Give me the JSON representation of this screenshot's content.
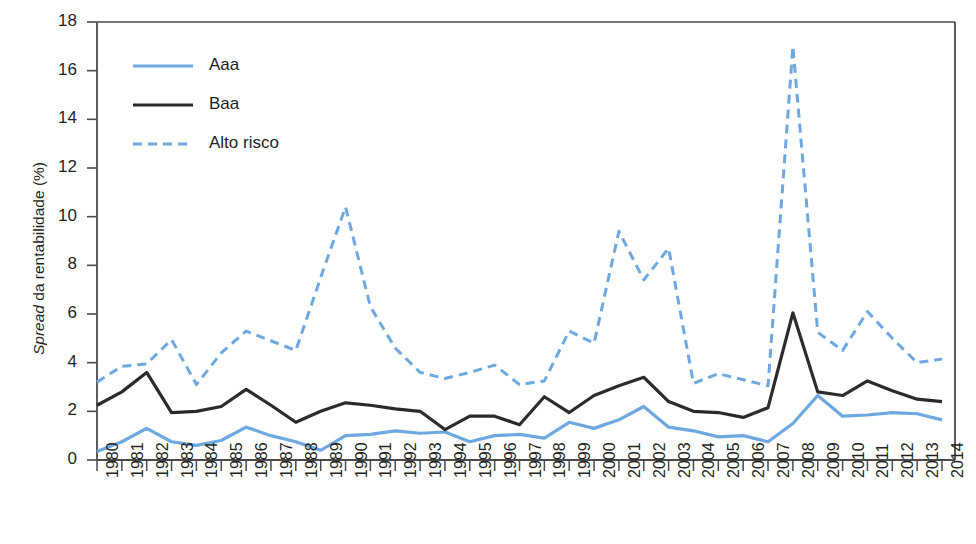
{
  "chart_data": {
    "type": "line",
    "title": "",
    "xlabel": "",
    "ylabel": "Spread da rentabilidade (%)",
    "ylabel_italic_prefix": "Spread",
    "ylabel_rest": " da rentabilidade (%)",
    "ylim": [
      0,
      18
    ],
    "yticks": [
      0,
      2,
      4,
      6,
      8,
      10,
      12,
      14,
      16,
      18
    ],
    "grid": false,
    "legend_position": "top-left-inside",
    "categories": [
      "1980",
      "1981",
      "1982",
      "1983",
      "1984",
      "1985",
      "1986",
      "1987",
      "1988",
      "1989",
      "1990",
      "1991",
      "1992",
      "1993",
      "1994",
      "1995",
      "1996",
      "1997",
      "1998",
      "1999",
      "2000",
      "2001",
      "2002",
      "2003",
      "2004",
      "2005",
      "2006",
      "2007",
      "2008",
      "2009",
      "2010",
      "2011",
      "2012",
      "2013",
      "2014"
    ],
    "series": [
      {
        "name": "Aaa",
        "style": "solid",
        "color": "#6ea8e0",
        "values": [
          0.35,
          0.75,
          1.3,
          0.75,
          0.6,
          0.8,
          1.35,
          1.0,
          0.75,
          0.4,
          1.0,
          1.05,
          1.2,
          1.1,
          1.15,
          0.75,
          1.0,
          1.05,
          0.9,
          1.55,
          1.3,
          1.65,
          2.2,
          1.35,
          1.2,
          0.95,
          1.0,
          0.75,
          1.5,
          2.65,
          1.8,
          1.85,
          1.95,
          1.9,
          1.65
        ]
      },
      {
        "name": "Baa",
        "style": "solid",
        "color": "#2b2b2b",
        "values": [
          2.25,
          2.8,
          3.6,
          1.95,
          2.0,
          2.2,
          2.9,
          2.25,
          1.55,
          2.0,
          2.35,
          2.25,
          2.1,
          2.0,
          1.25,
          1.8,
          1.8,
          1.45,
          2.6,
          1.95,
          2.65,
          3.05,
          3.4,
          2.4,
          2.0,
          1.95,
          1.75,
          2.15,
          6.05,
          2.8,
          2.65,
          3.25,
          2.85,
          2.5,
          2.4
        ]
      },
      {
        "name": "Alto risco",
        "style": "dashed",
        "color": "#6ea8e0",
        "values": [
          3.2,
          3.85,
          3.95,
          4.95,
          3.1,
          4.4,
          5.3,
          4.9,
          4.5,
          7.5,
          10.4,
          6.3,
          4.6,
          3.6,
          3.35,
          3.6,
          3.9,
          3.1,
          3.25,
          5.3,
          4.8,
          9.4,
          7.4,
          8.7,
          3.15,
          3.55,
          3.3,
          3.05,
          17.0,
          5.25,
          4.5,
          6.1,
          5.0,
          4.0,
          4.15
        ]
      }
    ]
  },
  "legend": {
    "items": [
      {
        "label": "Aaa",
        "color": "#6ea8e0",
        "style": "solid"
      },
      {
        "label": "Baa",
        "color": "#2b2b2b",
        "style": "solid"
      },
      {
        "label": "Alto risco",
        "color": "#6ea8e0",
        "style": "dashed"
      }
    ]
  },
  "colors": {
    "blue": "#6ea8e0",
    "black": "#2b2b2b",
    "axis": "#4a4a4a",
    "text": "#231f20",
    "background": "#ffffff"
  }
}
